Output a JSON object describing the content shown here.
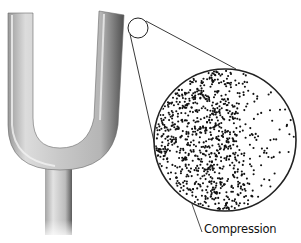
{
  "figure": {
    "magnifier_label": "Compression",
    "colors": {
      "background": "#ffffff",
      "fork_light": "#e6e6e6",
      "fork_mid": "#bdbdbd",
      "fork_dark": "#6e6e6e",
      "line": "#222222",
      "dot": "#111111"
    },
    "small_circle": {
      "cx": 138,
      "cy": 28,
      "r": 10
    },
    "large_circle": {
      "cx": 225,
      "cy": 140,
      "r": 71
    },
    "dots": {
      "count": 900,
      "seed": 7
    }
  }
}
